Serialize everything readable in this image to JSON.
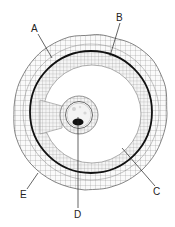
{
  "diagram": {
    "labels": [
      {
        "id": "A",
        "text": "A",
        "x": 34,
        "y": 32,
        "line": [
          38,
          34,
          52,
          58
        ]
      },
      {
        "id": "B",
        "text": "B",
        "x": 117,
        "y": 21,
        "line": [
          120,
          23,
          110,
          56
        ]
      },
      {
        "id": "C",
        "text": "C",
        "x": 155,
        "y": 195,
        "line": [
          155,
          186,
          122,
          148
        ]
      },
      {
        "id": "D",
        "text": "D",
        "x": 74,
        "y": 217,
        "line": [
          78,
          208,
          78,
          117
        ]
      },
      {
        "id": "E",
        "text": "E",
        "x": 21,
        "y": 198,
        "line": [
          27,
          189,
          38,
          173
        ]
      }
    ],
    "colors": {
      "stroke": "#555555",
      "membrane": "#111111",
      "nucleus": "#111111",
      "background": "#ffffff",
      "cell_fill": "#f2f2f2"
    }
  }
}
